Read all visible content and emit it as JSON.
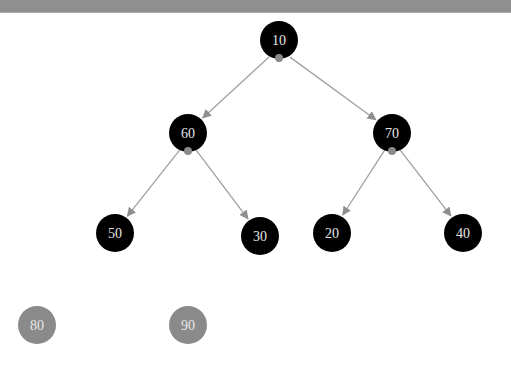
{
  "colors": {
    "topbar": "#8f8f8f",
    "node_active": "#000000",
    "node_inactive": "#8a8a8a",
    "edge": "#a0a0a0",
    "label": "#e8e8e8"
  },
  "tree": {
    "nodes": [
      {
        "id": "n10",
        "label": "10",
        "x": 279,
        "y": 40,
        "state": "active"
      },
      {
        "id": "n60",
        "label": "60",
        "x": 188,
        "y": 133,
        "state": "active"
      },
      {
        "id": "n70",
        "label": "70",
        "x": 392,
        "y": 133,
        "state": "active"
      },
      {
        "id": "n50",
        "label": "50",
        "x": 115,
        "y": 233,
        "state": "active"
      },
      {
        "id": "n30",
        "label": "30",
        "x": 260,
        "y": 236,
        "state": "active"
      },
      {
        "id": "n20",
        "label": "20",
        "x": 332,
        "y": 233,
        "state": "active"
      },
      {
        "id": "n40",
        "label": "40",
        "x": 463,
        "y": 233,
        "state": "active"
      }
    ],
    "edges": [
      {
        "from": "n10",
        "to": "n60"
      },
      {
        "from": "n10",
        "to": "n70"
      },
      {
        "from": "n60",
        "to": "n50"
      },
      {
        "from": "n60",
        "to": "n30"
      },
      {
        "from": "n70",
        "to": "n20"
      },
      {
        "from": "n70",
        "to": "n40"
      }
    ]
  },
  "pending": [
    {
      "id": "p80",
      "label": "80",
      "x": 37,
      "y": 325
    },
    {
      "id": "p90",
      "label": "90",
      "x": 188,
      "y": 325
    }
  ]
}
